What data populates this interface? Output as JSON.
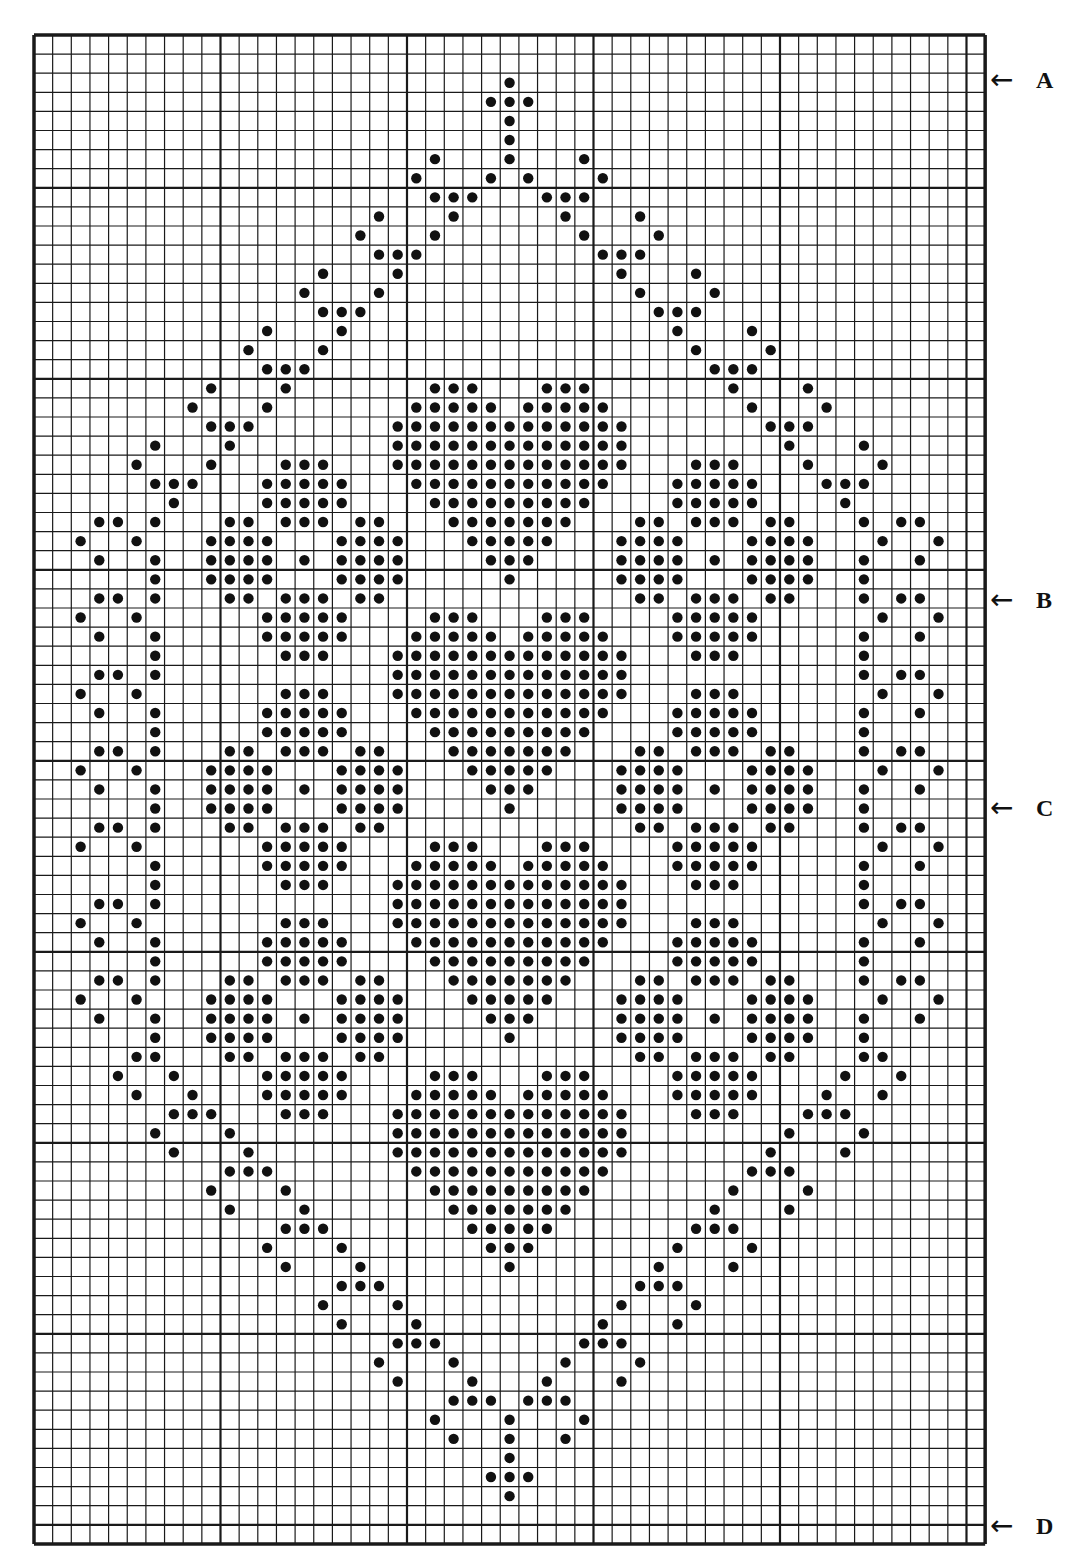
{
  "chart": {
    "type": "cross-stitch-grid",
    "columns": 51,
    "rows": 79,
    "major_every": 10,
    "origin_px": {
      "x": 32,
      "y": 33
    },
    "cell_px": {
      "w": 18.65,
      "h": 19.1
    },
    "major_offset": {
      "cols": 0,
      "rows": 8
    },
    "colors": {
      "line": "#1a1a1a",
      "dot": "#111111",
      "paper": "#ffffff"
    },
    "dots": [
      {
        "r": 2,
        "c": [
          25
        ]
      },
      {
        "r": 3,
        "c": [
          24,
          25,
          26
        ]
      },
      {
        "r": 4,
        "c": [
          25
        ]
      },
      {
        "r": 5,
        "c": [
          25
        ]
      },
      {
        "r": 6,
        "c": [
          21,
          25,
          29
        ]
      },
      {
        "r": 7,
        "c": [
          20,
          24,
          26,
          30
        ]
      },
      {
        "r": 8,
        "c": [
          21,
          22,
          23,
          27,
          28,
          29
        ]
      },
      {
        "r": 9,
        "c": [
          18,
          22,
          28,
          32
        ]
      },
      {
        "r": 10,
        "c": [
          17,
          21,
          29,
          33
        ]
      },
      {
        "r": 11,
        "c": [
          18,
          19,
          20,
          30,
          31,
          32
        ]
      },
      {
        "r": 12,
        "c": [
          15,
          19,
          31,
          35
        ]
      },
      {
        "r": 13,
        "c": [
          14,
          18,
          32,
          36
        ]
      },
      {
        "r": 14,
        "c": [
          15,
          16,
          17,
          33,
          34,
          35
        ]
      },
      {
        "r": 15,
        "c": [
          12,
          16,
          34,
          38
        ]
      },
      {
        "r": 16,
        "c": [
          11,
          15,
          35,
          39
        ]
      },
      {
        "r": 17,
        "c": [
          12,
          13,
          14,
          36,
          37,
          38
        ]
      },
      {
        "r": 18,
        "c": [
          9,
          13,
          21,
          22,
          23,
          27,
          28,
          29,
          37,
          41
        ]
      },
      {
        "r": 19,
        "c": [
          8,
          12,
          20,
          21,
          22,
          23,
          24,
          26,
          27,
          28,
          29,
          30,
          38,
          42
        ]
      },
      {
        "r": 20,
        "c": [
          9,
          10,
          11,
          19,
          20,
          21,
          22,
          23,
          24,
          25,
          26,
          27,
          28,
          29,
          30,
          31,
          39,
          40,
          41
        ]
      },
      {
        "r": 21,
        "c": [
          6,
          10,
          19,
          20,
          21,
          22,
          23,
          24,
          25,
          26,
          27,
          28,
          29,
          30,
          31,
          40,
          44
        ]
      },
      {
        "r": 22,
        "c": [
          5,
          9,
          13,
          14,
          15,
          19,
          20,
          21,
          22,
          23,
          24,
          25,
          26,
          27,
          28,
          29,
          30,
          31,
          35,
          36,
          37,
          41,
          45
        ]
      },
      {
        "r": 23,
        "c": [
          6,
          7,
          8,
          12,
          13,
          14,
          15,
          16,
          20,
          21,
          22,
          23,
          24,
          25,
          26,
          27,
          28,
          29,
          30,
          34,
          35,
          36,
          37,
          38,
          42,
          43,
          44
        ]
      },
      {
        "r": 24,
        "c": [
          7,
          12,
          13,
          14,
          15,
          16,
          21,
          22,
          23,
          24,
          25,
          26,
          27,
          28,
          29,
          34,
          35,
          36,
          37,
          38,
          43
        ]
      },
      {
        "r": 25,
        "c": [
          3,
          4,
          6,
          10,
          11,
          13,
          14,
          15,
          17,
          18,
          22,
          23,
          24,
          25,
          26,
          27,
          28,
          32,
          33,
          35,
          36,
          37,
          39,
          40,
          44,
          46,
          47
        ]
      },
      {
        "r": 26,
        "c": [
          2,
          5,
          9,
          10,
          11,
          12,
          16,
          17,
          18,
          19,
          23,
          24,
          25,
          26,
          27,
          31,
          32,
          33,
          34,
          38,
          39,
          40,
          41,
          45,
          48
        ]
      },
      {
        "r": 27,
        "c": [
          3,
          6,
          9,
          10,
          11,
          12,
          14,
          16,
          17,
          18,
          19,
          24,
          25,
          26,
          31,
          32,
          33,
          34,
          36,
          38,
          39,
          40,
          41,
          44,
          47
        ]
      },
      {
        "r": 28,
        "c": [
          6,
          9,
          10,
          11,
          12,
          16,
          17,
          18,
          19,
          25,
          31,
          32,
          33,
          34,
          38,
          39,
          40,
          41,
          44
        ]
      },
      {
        "r": 29,
        "c": [
          3,
          4,
          6,
          10,
          11,
          13,
          14,
          15,
          17,
          18,
          32,
          33,
          35,
          36,
          37,
          39,
          40,
          44,
          46,
          47
        ]
      },
      {
        "r": 30,
        "c": [
          2,
          5,
          12,
          13,
          14,
          15,
          16,
          21,
          22,
          23,
          27,
          28,
          29,
          34,
          35,
          36,
          37,
          38,
          45,
          48
        ]
      },
      {
        "r": 31,
        "c": [
          3,
          6,
          12,
          13,
          14,
          15,
          16,
          20,
          21,
          22,
          23,
          24,
          26,
          27,
          28,
          29,
          30,
          34,
          35,
          36,
          37,
          38,
          44,
          47
        ]
      },
      {
        "r": 32,
        "c": [
          6,
          13,
          14,
          15,
          19,
          20,
          21,
          22,
          23,
          24,
          25,
          26,
          27,
          28,
          29,
          30,
          31,
          35,
          36,
          37,
          44
        ]
      },
      {
        "r": 33,
        "c": [
          3,
          4,
          6,
          19,
          20,
          21,
          22,
          23,
          24,
          25,
          26,
          27,
          28,
          29,
          30,
          31,
          44,
          46,
          47
        ]
      },
      {
        "r": 34,
        "c": [
          2,
          5,
          13,
          14,
          15,
          19,
          20,
          21,
          22,
          23,
          24,
          25,
          26,
          27,
          28,
          29,
          30,
          31,
          35,
          36,
          37,
          45,
          48
        ]
      },
      {
        "r": 35,
        "c": [
          3,
          6,
          12,
          13,
          14,
          15,
          16,
          20,
          21,
          22,
          23,
          24,
          25,
          26,
          27,
          28,
          29,
          30,
          34,
          35,
          36,
          37,
          38,
          44,
          47
        ]
      },
      {
        "r": 36,
        "c": [
          6,
          12,
          13,
          14,
          15,
          16,
          21,
          22,
          23,
          24,
          25,
          26,
          27,
          28,
          29,
          34,
          35,
          36,
          37,
          38,
          44
        ]
      },
      {
        "r": 37,
        "c": [
          3,
          4,
          6,
          10,
          11,
          13,
          14,
          15,
          17,
          18,
          22,
          23,
          24,
          25,
          26,
          27,
          28,
          32,
          33,
          35,
          36,
          37,
          39,
          40,
          44,
          46,
          47
        ]
      },
      {
        "r": 38,
        "c": [
          2,
          5,
          9,
          10,
          11,
          12,
          16,
          17,
          18,
          19,
          23,
          24,
          25,
          26,
          27,
          31,
          32,
          33,
          34,
          38,
          39,
          40,
          41,
          45,
          48
        ]
      },
      {
        "r": 39,
        "c": [
          3,
          6,
          9,
          10,
          11,
          12,
          14,
          16,
          17,
          18,
          19,
          24,
          25,
          26,
          31,
          32,
          33,
          34,
          36,
          38,
          39,
          40,
          41,
          44,
          47
        ]
      },
      {
        "r": 40,
        "c": [
          6,
          9,
          10,
          11,
          12,
          16,
          17,
          18,
          19,
          25,
          31,
          32,
          33,
          34,
          38,
          39,
          40,
          41,
          44
        ]
      },
      {
        "r": 41,
        "c": [
          3,
          4,
          6,
          10,
          11,
          13,
          14,
          15,
          17,
          18,
          32,
          33,
          35,
          36,
          37,
          39,
          40,
          44,
          46,
          47
        ]
      },
      {
        "r": 42,
        "c": [
          2,
          5,
          12,
          13,
          14,
          15,
          16,
          21,
          22,
          23,
          27,
          28,
          29,
          34,
          35,
          36,
          37,
          38,
          45,
          48
        ]
      },
      {
        "r": 43,
        "c": [
          6,
          12,
          13,
          14,
          15,
          16,
          20,
          21,
          22,
          23,
          24,
          26,
          27,
          28,
          29,
          30,
          34,
          35,
          36,
          37,
          38,
          44,
          47
        ]
      },
      {
        "r": 44,
        "c": [
          6,
          13,
          14,
          15,
          19,
          20,
          21,
          22,
          23,
          24,
          25,
          26,
          27,
          28,
          29,
          30,
          31,
          35,
          36,
          37,
          44
        ]
      },
      {
        "r": 45,
        "c": [
          3,
          4,
          6,
          19,
          20,
          21,
          22,
          23,
          24,
          25,
          26,
          27,
          28,
          29,
          30,
          31,
          44,
          46,
          47
        ]
      },
      {
        "r": 46,
        "c": [
          2,
          5,
          13,
          14,
          15,
          19,
          20,
          21,
          22,
          23,
          24,
          25,
          26,
          27,
          28,
          29,
          30,
          31,
          35,
          36,
          37,
          45,
          48
        ]
      },
      {
        "r": 47,
        "c": [
          3,
          6,
          12,
          13,
          14,
          15,
          16,
          20,
          21,
          22,
          23,
          24,
          25,
          26,
          27,
          28,
          29,
          30,
          34,
          35,
          36,
          37,
          38,
          44,
          47
        ]
      },
      {
        "r": 48,
        "c": [
          6,
          12,
          13,
          14,
          15,
          16,
          21,
          22,
          23,
          24,
          25,
          26,
          27,
          28,
          29,
          34,
          35,
          36,
          37,
          38,
          44
        ]
      },
      {
        "r": 49,
        "c": [
          3,
          4,
          6,
          10,
          11,
          13,
          14,
          15,
          17,
          18,
          22,
          23,
          24,
          25,
          26,
          27,
          28,
          32,
          33,
          35,
          36,
          37,
          39,
          40,
          44,
          46,
          47
        ]
      },
      {
        "r": 50,
        "c": [
          2,
          5,
          9,
          10,
          11,
          12,
          16,
          17,
          18,
          19,
          23,
          24,
          25,
          26,
          27,
          31,
          32,
          33,
          34,
          38,
          39,
          40,
          41,
          45,
          48
        ]
      },
      {
        "r": 51,
        "c": [
          3,
          6,
          9,
          10,
          11,
          12,
          14,
          16,
          17,
          18,
          19,
          24,
          25,
          26,
          31,
          32,
          33,
          34,
          36,
          38,
          39,
          40,
          41,
          44,
          47
        ]
      },
      {
        "r": 52,
        "c": [
          6,
          9,
          10,
          11,
          12,
          16,
          17,
          18,
          19,
          25,
          31,
          32,
          33,
          34,
          38,
          39,
          40,
          41,
          44
        ]
      },
      {
        "r": 53,
        "c": [
          5,
          6,
          10,
          11,
          13,
          14,
          15,
          17,
          18,
          32,
          33,
          35,
          36,
          37,
          39,
          40,
          44,
          45
        ]
      },
      {
        "r": 54,
        "c": [
          4,
          7,
          12,
          13,
          14,
          15,
          16,
          21,
          22,
          23,
          27,
          28,
          29,
          34,
          35,
          36,
          37,
          38,
          43,
          46
        ]
      },
      {
        "r": 55,
        "c": [
          5,
          8,
          12,
          13,
          14,
          15,
          16,
          20,
          21,
          22,
          23,
          24,
          26,
          27,
          28,
          29,
          30,
          34,
          35,
          36,
          37,
          38,
          42,
          45
        ]
      },
      {
        "r": 56,
        "c": [
          7,
          8,
          9,
          13,
          14,
          15,
          19,
          20,
          21,
          22,
          23,
          24,
          25,
          26,
          27,
          28,
          29,
          30,
          31,
          35,
          36,
          37,
          41,
          42,
          43
        ]
      },
      {
        "r": 57,
        "c": [
          6,
          10,
          19,
          20,
          21,
          22,
          23,
          24,
          25,
          26,
          27,
          28,
          29,
          30,
          31,
          40,
          44
        ]
      },
      {
        "r": 58,
        "c": [
          7,
          11,
          19,
          20,
          21,
          22,
          23,
          24,
          25,
          26,
          27,
          28,
          29,
          30,
          31,
          39,
          43
        ]
      },
      {
        "r": 59,
        "c": [
          10,
          11,
          12,
          20,
          21,
          22,
          23,
          24,
          25,
          26,
          27,
          28,
          29,
          30,
          38,
          39,
          40
        ]
      },
      {
        "r": 60,
        "c": [
          9,
          13,
          21,
          22,
          23,
          24,
          25,
          26,
          27,
          28,
          29,
          37,
          41
        ]
      },
      {
        "r": 61,
        "c": [
          10,
          14,
          22,
          23,
          24,
          25,
          26,
          27,
          28,
          36,
          40
        ]
      },
      {
        "r": 62,
        "c": [
          13,
          14,
          15,
          23,
          24,
          25,
          26,
          27,
          35,
          36,
          37
        ]
      },
      {
        "r": 63,
        "c": [
          12,
          16,
          24,
          25,
          26,
          34,
          38
        ]
      },
      {
        "r": 64,
        "c": [
          13,
          17,
          25,
          33,
          37
        ]
      },
      {
        "r": 65,
        "c": [
          16,
          17,
          18,
          32,
          33,
          34
        ]
      },
      {
        "r": 66,
        "c": [
          15,
          19,
          31,
          35
        ]
      },
      {
        "r": 67,
        "c": [
          16,
          20,
          30,
          34
        ]
      },
      {
        "r": 68,
        "c": [
          19,
          20,
          21,
          29,
          30,
          31
        ]
      },
      {
        "r": 69,
        "c": [
          18,
          22,
          28,
          32
        ]
      },
      {
        "r": 70,
        "c": [
          19,
          23,
          27,
          31
        ]
      },
      {
        "r": 71,
        "c": [
          22,
          23,
          24,
          26,
          27,
          28
        ]
      },
      {
        "r": 72,
        "c": [
          21,
          25,
          29
        ]
      },
      {
        "r": 73,
        "c": [
          22,
          25,
          28
        ]
      },
      {
        "r": 74,
        "c": [
          25
        ]
      },
      {
        "r": 75,
        "c": [
          24,
          25,
          26
        ]
      },
      {
        "r": 76,
        "c": [
          25
        ]
      }
    ]
  },
  "markers": [
    {
      "label": "A",
      "row": 2,
      "y_px": 80
    },
    {
      "label": "B",
      "row": 29,
      "y_px": 600
    },
    {
      "label": "C",
      "row": 40,
      "y_px": 808
    },
    {
      "label": "D",
      "row": 76,
      "y_px": 1526
    }
  ],
  "icons": {
    "arrow": "←"
  }
}
